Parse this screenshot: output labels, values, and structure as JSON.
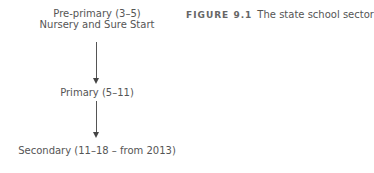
{
  "caption": {
    "label": "FIGURE 9.1",
    "title": "The state school sector"
  },
  "nodes": [
    {
      "line1": "Pre-primary (3–5)",
      "line2": "Nursery and Sure Start"
    },
    {
      "line1": "Primary (5–11)"
    },
    {
      "line1": "Secondary (11–18 – from 2013)"
    }
  ]
}
